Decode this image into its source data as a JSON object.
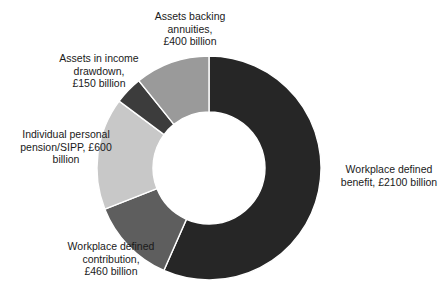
{
  "chart_data": {
    "type": "pie",
    "variant": "donut",
    "title": "",
    "subtitle": "",
    "xlabel": "",
    "ylabel": "",
    "units": "£ billion",
    "currency_symbol": "£",
    "total": 3710,
    "grid": false,
    "legend_position": "none",
    "labels_position": "outside",
    "start_angle_deg": 0,
    "direction": "clockwise",
    "inner_radius_ratio": 0.5,
    "categories": [
      "Workplace defined benefit",
      "Workplace defined contribution",
      "Individual personal pension/SIPP",
      "Assets in income drawdown",
      "Assets backing annuities"
    ],
    "values": [
      2100,
      460,
      600,
      150,
      400
    ],
    "colors": [
      "#262626",
      "#5e5e5e",
      "#c8c8c8",
      "#3c3c3c",
      "#9a9a9a"
    ],
    "slices": [
      {
        "name": "Workplace defined benefit",
        "value": 2100,
        "label": "Workplace defined\nbenefit, £2100 billion",
        "color": "#262626",
        "percent": 56.6
      },
      {
        "name": "Workplace defined contribution",
        "value": 460,
        "label": "Workplace defined\ncontribution,\n£460 billion",
        "color": "#5e5e5e",
        "percent": 12.4
      },
      {
        "name": "Individual personal pension/SIPP",
        "value": 600,
        "label": "Individual personal\npension/SIPP, £600\nbillion",
        "color": "#c8c8c8",
        "percent": 16.2
      },
      {
        "name": "Assets in income drawdown",
        "value": 150,
        "label": "Assets in income\ndrawdown,\n£150 billion",
        "color": "#3c3c3c",
        "percent": 4.0
      },
      {
        "name": "Assets backing annuities",
        "value": 400,
        "label": "Assets backing\nannuities,\n£400 billion",
        "color": "#9a9a9a",
        "percent": 10.8
      }
    ]
  }
}
